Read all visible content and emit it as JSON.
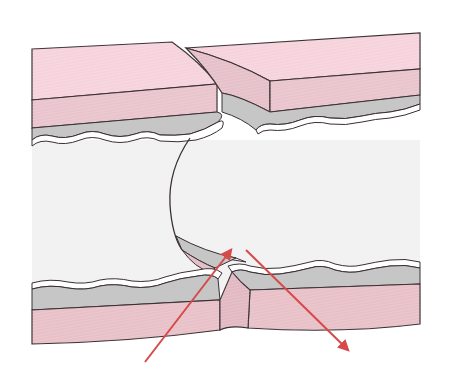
{
  "diagram": {
    "title": "",
    "labels": [],
    "colors": {
      "background": "#ffffff",
      "outer_wall_top": "#f6d3dc",
      "outer_wall_front": "#e9c4cc",
      "outer_wall_bottom": "#e8c0c8",
      "submucosa_gray": "#c6c6c6",
      "mucosa_white_line": "#ffffff",
      "lumen": "#f2f2f2",
      "outline": "#3a3034",
      "arrow": "#d64a4a"
    },
    "arrows": [
      {
        "name": "arrow-inward",
        "from": [
          145,
          362
        ],
        "to": [
          232,
          248
        ]
      },
      {
        "name": "arrow-outward",
        "from": [
          246,
          250
        ],
        "to": [
          350,
          352
        ]
      }
    ]
  }
}
